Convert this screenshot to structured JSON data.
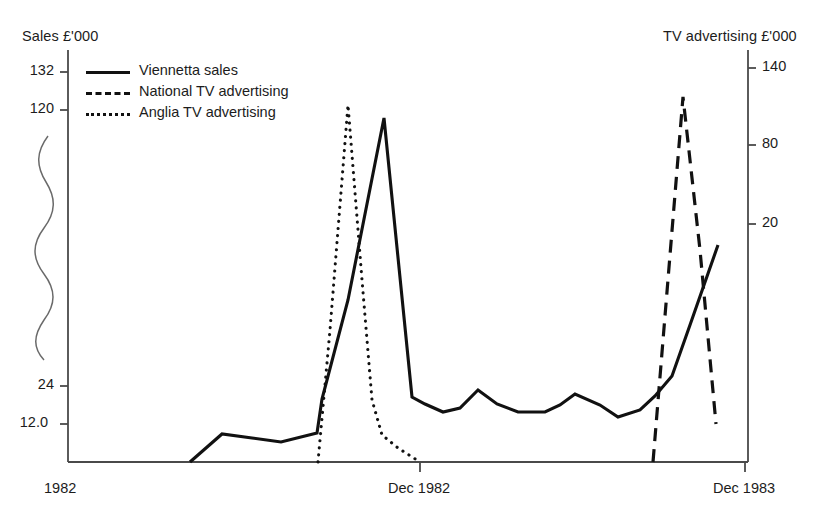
{
  "chart_data": {
    "type": "line",
    "title": "",
    "subtitle": "",
    "xlabel": "",
    "ylabel": "Sales £'000",
    "y2label": "TV advertising £'000",
    "grid": false,
    "legend_position": "top-left",
    "axis_break": true,
    "axis_break_note": "wavy break on the sales axis between 24 and 120",
    "x_tick_labels": [
      "1982",
      "Dec 1982",
      "Dec 1983"
    ],
    "x_tick_positions": [
      68,
      420,
      745
    ],
    "y_left_tick_labels": [
      "132",
      "120",
      "24",
      "12.0"
    ],
    "y_left_tick_values": [
      132,
      120,
      24,
      12.0
    ],
    "y_left_tick_positions": [
      72,
      110,
      386,
      424
    ],
    "y_right_tick_labels": [
      "140",
      "80",
      "20"
    ],
    "y_right_tick_values": [
      140,
      80,
      20
    ],
    "y_right_tick_positions": [
      68,
      145,
      224
    ],
    "series": [
      {
        "name": "Viennetta sales",
        "style": "solid",
        "axis": "left",
        "points": [
          [
            190,
            462
          ],
          [
            222,
            434
          ],
          [
            252,
            438
          ],
          [
            281,
            442
          ],
          [
            317,
            433
          ],
          [
            322,
            399
          ],
          [
            348,
            300
          ],
          [
            384,
            118
          ],
          [
            412,
            397
          ],
          [
            425,
            404
          ],
          [
            443,
            412
          ],
          [
            460,
            408
          ],
          [
            478,
            390
          ],
          [
            497,
            404
          ],
          [
            518,
            412
          ],
          [
            545,
            412
          ],
          [
            560,
            405
          ],
          [
            575,
            394
          ],
          [
            600,
            405
          ],
          [
            618,
            417
          ],
          [
            640,
            410
          ],
          [
            655,
            396
          ],
          [
            672,
            376
          ],
          [
            690,
            325
          ],
          [
            718,
            245
          ]
        ]
      },
      {
        "name": "National TV advertising",
        "style": "dashed",
        "axis": "right",
        "points": [
          [
            653,
            462
          ],
          [
            683,
            97
          ],
          [
            700,
            250
          ],
          [
            716,
            424
          ]
        ]
      },
      {
        "name": "Anglia TV advertising",
        "style": "dotted",
        "axis": "right",
        "points": [
          [
            318,
            462
          ],
          [
            330,
            330
          ],
          [
            348,
            105
          ],
          [
            362,
            280
          ],
          [
            372,
            400
          ],
          [
            382,
            435
          ],
          [
            398,
            448
          ],
          [
            420,
            462
          ]
        ]
      }
    ]
  },
  "axes": {
    "left_title": "Sales £'000",
    "right_title": "TV advertising £'000"
  },
  "legend": {
    "items": [
      {
        "label": "Viennetta sales",
        "key": "solid-line-key"
      },
      {
        "label": "National TV advertising",
        "key": "dashed-line-key"
      },
      {
        "label": "Anglia TV advertising",
        "key": "dotted-line-key"
      }
    ]
  },
  "ticks": {
    "left": [
      {
        "label": "132",
        "y": 72
      },
      {
        "label": "120",
        "y": 110
      },
      {
        "label": "24",
        "y": 386
      },
      {
        "label": "12.0",
        "y": 424
      }
    ],
    "right": [
      {
        "label": "140",
        "y": 68
      },
      {
        "label": "80",
        "y": 145
      },
      {
        "label": "20",
        "y": 224
      }
    ],
    "x": [
      {
        "label": "1982",
        "x": 44
      },
      {
        "label": "Dec 1982",
        "x": 388
      },
      {
        "label": "Dec 1983",
        "x": 713
      }
    ]
  },
  "colors": {
    "ink": "#111111",
    "axis": "#4a4a4a",
    "background": "#ffffff"
  }
}
